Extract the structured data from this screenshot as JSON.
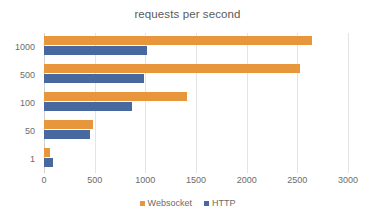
{
  "chart_data": {
    "type": "bar",
    "orientation": "horizontal",
    "title": "requests per second",
    "xlabel": "",
    "ylabel": "",
    "categories": [
      "1000",
      "500",
      "100",
      "50",
      "1"
    ],
    "series": [
      {
        "name": "Websocket",
        "color": "#E8963C",
        "values": [
          2640,
          2530,
          1410,
          480,
          60
        ]
      },
      {
        "name": "HTTP",
        "color": "#47699F",
        "values": [
          1020,
          990,
          870,
          450,
          90
        ]
      }
    ],
    "xlim": [
      0,
      3000
    ],
    "xticks": [
      0,
      500,
      1000,
      1500,
      2000,
      2500,
      3000
    ],
    "xtick_labels": [
      "0",
      "500",
      "1000",
      "1500",
      "2000",
      "2500",
      "3000"
    ],
    "grid": true,
    "grid_axis": "x",
    "legend": {
      "position": "bottom",
      "entries": [
        {
          "label": "Websocket",
          "color": "#E8963C"
        },
        {
          "label": "HTTP",
          "color": "#47699F"
        }
      ]
    }
  }
}
